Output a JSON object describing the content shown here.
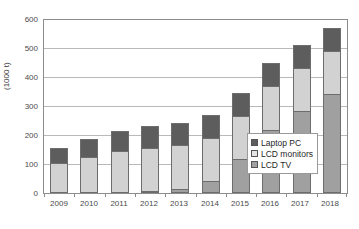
{
  "chart_data": {
    "type": "bar",
    "subtype": "stacked-vertical",
    "title": "",
    "xlabel": "",
    "ylabel": "(1000 t)",
    "ylim": [
      0,
      600
    ],
    "ytick_step": 100,
    "yticks": [
      "0",
      "100",
      "200",
      "300",
      "400",
      "500",
      "600"
    ],
    "grid": true,
    "legend_position": "inside-right-lower",
    "categories": [
      "2009",
      "2010",
      "2011",
      "2012",
      "2013",
      "2014",
      "2015",
      "2016",
      "2017",
      "2018"
    ],
    "series": [
      {
        "name": "LCD TV",
        "color": "#a0a0a0",
        "values": [
          0,
          0,
          0,
          5,
          13,
          42,
          119,
          219,
          283,
          342
        ]
      },
      {
        "name": "LCD monitors",
        "color": "#d2d2d2",
        "values": [
          105,
          126,
          145,
          149,
          152,
          148,
          149,
          152,
          150,
          149
        ]
      },
      {
        "name": "Laptop PC",
        "color": "#5d5d5d",
        "values": [
          50,
          61,
          70,
          78,
          78,
          79,
          78,
          79,
          79,
          81
        ]
      }
    ],
    "totals": [
      155,
      187,
      215,
      232,
      243,
      269,
      346,
      450,
      512,
      572
    ]
  },
  "axes": {
    "y_title": "(1000 t)",
    "y_tick_labels": [
      "600",
      "500",
      "400",
      "300",
      "200",
      "100",
      "0"
    ],
    "x_tick_labels": [
      "2009",
      "2010",
      "2011",
      "2012",
      "2013",
      "2014",
      "2015",
      "2016",
      "2017",
      "2018"
    ]
  },
  "legend": {
    "items": [
      {
        "label": "Laptop PC",
        "swatch": "laptop-pc-swatch"
      },
      {
        "label": "LCD monitors",
        "swatch": "lcd-monitors-swatch"
      },
      {
        "label": "LCD TV",
        "swatch": "lcd-tv-swatch"
      }
    ]
  },
  "colors": {
    "laptop_pc": "#5d5d5d",
    "lcd_monitors": "#d2d2d2",
    "lcd_tv": "#a0a0a0",
    "gridline": "#b9b9b9",
    "frame": "#8d8d8d",
    "text": "#4a4a4a",
    "background": "#ffffff"
  }
}
